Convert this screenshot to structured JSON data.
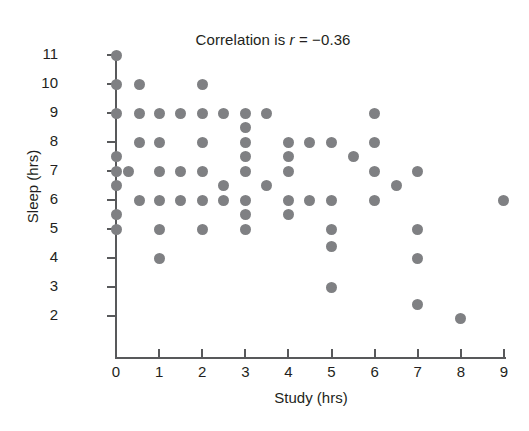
{
  "chart_data": {
    "type": "scatter",
    "title": "Correlation is r = −0.36",
    "title_prefix": "Correlation is ",
    "title_symbol": "r",
    "title_suffix": " = −0.36",
    "correlation_r": -0.36,
    "xlabel": "Study (hrs)",
    "ylabel": "Sleep (hrs)",
    "xlim": [
      -0.45,
      9.4
    ],
    "ylim": [
      1.3,
      11.45
    ],
    "xticks": [
      0,
      1,
      2,
      3,
      4,
      5,
      6,
      7,
      8,
      9
    ],
    "yticks": [
      2,
      3,
      4,
      5,
      6,
      7,
      8,
      9,
      10,
      11
    ],
    "xticklabels": [
      "0",
      "1",
      "2",
      "3",
      "4",
      "5",
      "6",
      "7",
      "8",
      "9"
    ],
    "yticklabels": [
      "2",
      "3",
      "4",
      "5",
      "6",
      "7",
      "8",
      "9",
      "10",
      "11"
    ],
    "grid": false,
    "legend": false,
    "marker": "circle",
    "marker_color": "#7f8083",
    "marker_size_px": 11,
    "n_points": 61,
    "points": [
      [
        0,
        11
      ],
      [
        0,
        10
      ],
      [
        0,
        9
      ],
      [
        0,
        7.5
      ],
      [
        0,
        7
      ],
      [
        0.3,
        7
      ],
      [
        0,
        6.5
      ],
      [
        0,
        5.5
      ],
      [
        0,
        5
      ],
      [
        0.55,
        10
      ],
      [
        0.55,
        9
      ],
      [
        0.55,
        8
      ],
      [
        0.55,
        6
      ],
      [
        1,
        9
      ],
      [
        1,
        8
      ],
      [
        1,
        7
      ],
      [
        1,
        6
      ],
      [
        1,
        5
      ],
      [
        1,
        4
      ],
      [
        1.5,
        9
      ],
      [
        1.5,
        7
      ],
      [
        1.5,
        6
      ],
      [
        2,
        10
      ],
      [
        2,
        9
      ],
      [
        2,
        8
      ],
      [
        2,
        7
      ],
      [
        2,
        6
      ],
      [
        2,
        5
      ],
      [
        2.5,
        9
      ],
      [
        2.5,
        6.5
      ],
      [
        2.5,
        6
      ],
      [
        3,
        9
      ],
      [
        3,
        8.5
      ],
      [
        3,
        8
      ],
      [
        3,
        7.5
      ],
      [
        3,
        7
      ],
      [
        3,
        6
      ],
      [
        3,
        5.5
      ],
      [
        3,
        5
      ],
      [
        3.5,
        9
      ],
      [
        3.5,
        6.5
      ],
      [
        4,
        8
      ],
      [
        4,
        7.5
      ],
      [
        4,
        7
      ],
      [
        4,
        6
      ],
      [
        4,
        5.5
      ],
      [
        4.5,
        8
      ],
      [
        4.5,
        6
      ],
      [
        5,
        8
      ],
      [
        5,
        6
      ],
      [
        5,
        5
      ],
      [
        5,
        4.4
      ],
      [
        5,
        3
      ],
      [
        5.5,
        7.5
      ],
      [
        6,
        9
      ],
      [
        6,
        8
      ],
      [
        6,
        7
      ],
      [
        6,
        6
      ],
      [
        6.5,
        6.5
      ],
      [
        7,
        7
      ],
      [
        7,
        5
      ],
      [
        7,
        4
      ],
      [
        7,
        2.4
      ],
      [
        8,
        1.9
      ],
      [
        9,
        6
      ]
    ]
  },
  "geometry": {
    "x0_px": 116,
    "x_unit_px": 43.1,
    "y_base_value": 2,
    "y_base_px": 316,
    "y_unit_px": 29.0
  }
}
